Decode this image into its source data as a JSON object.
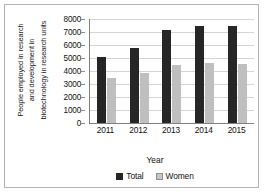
{
  "chart_data": {
    "type": "bar",
    "title": "",
    "xlabel": "Year",
    "ylabel": "People employed in research and development in biotechnology in research units",
    "ylabel_lines": [
      "People employed in research",
      "and development in",
      "biotechnology in research units"
    ],
    "categories": [
      "2011",
      "2012",
      "2013",
      "2014",
      "2015"
    ],
    "series": [
      {
        "name": "Total",
        "color": "#262626",
        "values": [
          5100,
          5750,
          7150,
          7500,
          7450
        ]
      },
      {
        "name": "Women",
        "color": "#bfbfbf",
        "values": [
          3450,
          3850,
          4450,
          4650,
          4550
        ]
      }
    ],
    "ylim": [
      0,
      8000
    ],
    "ytick_values": [
      0,
      1000,
      2000,
      3000,
      4000,
      5000,
      6000,
      7000,
      8000
    ],
    "ytick_labels": [
      "0",
      "1000",
      "2000",
      "3000",
      "4000",
      "5000",
      "6000",
      "7000",
      "8000"
    ],
    "grid": true,
    "grid_axis": "y",
    "legend_position": "bottom",
    "legend": [
      {
        "label": "Total",
        "swatch": "dark-square-swatch"
      },
      {
        "label": "Women",
        "swatch": "light-square-swatch"
      }
    ]
  },
  "colors": {
    "total": "#262626",
    "women": "#bfbfbf",
    "gridline": "#d4d4d4",
    "axis": "#808080",
    "frame_border": "#b4b4b4",
    "text": "#111111",
    "background": "#ffffff"
  }
}
